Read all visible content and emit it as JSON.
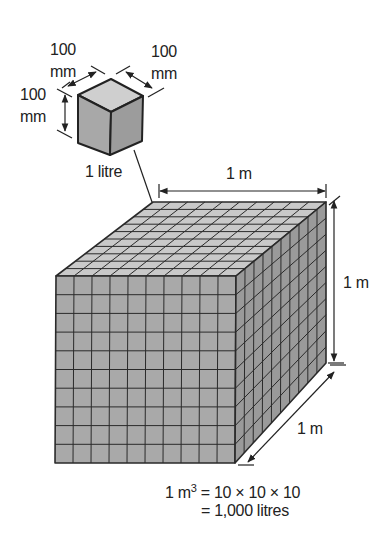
{
  "small_cube": {
    "caption": "1 litre",
    "dim_left_value": "100",
    "dim_left_unit": "mm",
    "dim_top_left_value": "100",
    "dim_top_left_unit": "mm",
    "dim_top_right_value": "100",
    "dim_top_right_unit": "mm"
  },
  "large_cube": {
    "width_label": "1 m",
    "height_label": "1 m",
    "depth_label": "1 m",
    "grid_divisions": 10
  },
  "equation": {
    "line1_prefix": "1 m",
    "line1_exponent": "3",
    "line1_rest": " = 10 × 10 × 10",
    "line2": "= 1,000 litres"
  },
  "colors": {
    "top_face": "#c9c9c9",
    "front_face": "#a9a9a9",
    "side_face": "#9a9a9a",
    "line": "#2a2a2a"
  }
}
